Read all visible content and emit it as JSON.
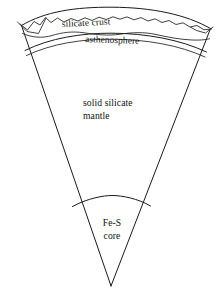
{
  "figure": {
    "kind": "planetary-interior-cross-section",
    "background_color": "#ffffff",
    "line_color": "#1a1a1a",
    "text_color": "#111111"
  },
  "labels": {
    "crust": "silicate crust",
    "asthenosphere": "asthenosphere",
    "mantle_line1": "solid silicate",
    "mantle_line2": "mantle",
    "core_line1": "Fe-S",
    "core_line2": "core"
  },
  "layers": [
    {
      "name": "silicate crust",
      "order": 1,
      "position": "outermost",
      "boundary_style": "irregular jagged"
    },
    {
      "name": "asthenosphere",
      "order": 2,
      "position": "below crust",
      "boundary_style": "wavy above, smooth arc below"
    },
    {
      "name": "solid silicate mantle",
      "order": 3,
      "position": "middle",
      "boundary_style": "smooth arcs"
    },
    {
      "name": "Fe-S core",
      "order": 4,
      "position": "innermost",
      "boundary_style": "smooth arc above, wedge apex below"
    }
  ]
}
